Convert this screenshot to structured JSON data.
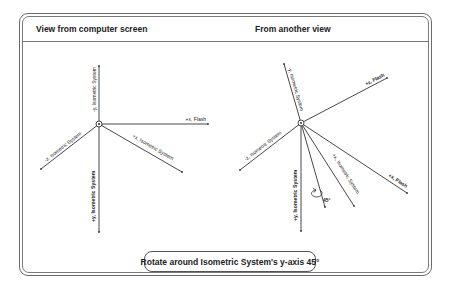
{
  "panels": {
    "left": {
      "title": "View from computer screen",
      "axes": {
        "neg_y": "-y, Isometric System",
        "pos_x_flash": "+x, Flash",
        "neg_z": "-z, Isometric System",
        "pos_x_iso": "+x, Isometric System",
        "pos_y": "+y, Isometric System"
      }
    },
    "right": {
      "title": "From another view",
      "axes": {
        "neg_y": "-y, Isometric System",
        "pos_z_flash": "+z, Flash",
        "neg_z": "-z, Isometric System",
        "pos_x_iso": "+x, Isometric System",
        "pos_x_flash": "+x, Flash",
        "pos_y": "+y, Isometric System",
        "rotation_angle": "45°"
      }
    }
  },
  "caption": "Rotate around Isometric System's y-axis 45°",
  "colors": {
    "line": "#333333",
    "frame": "#6a6a6a",
    "text": "#222222"
  }
}
